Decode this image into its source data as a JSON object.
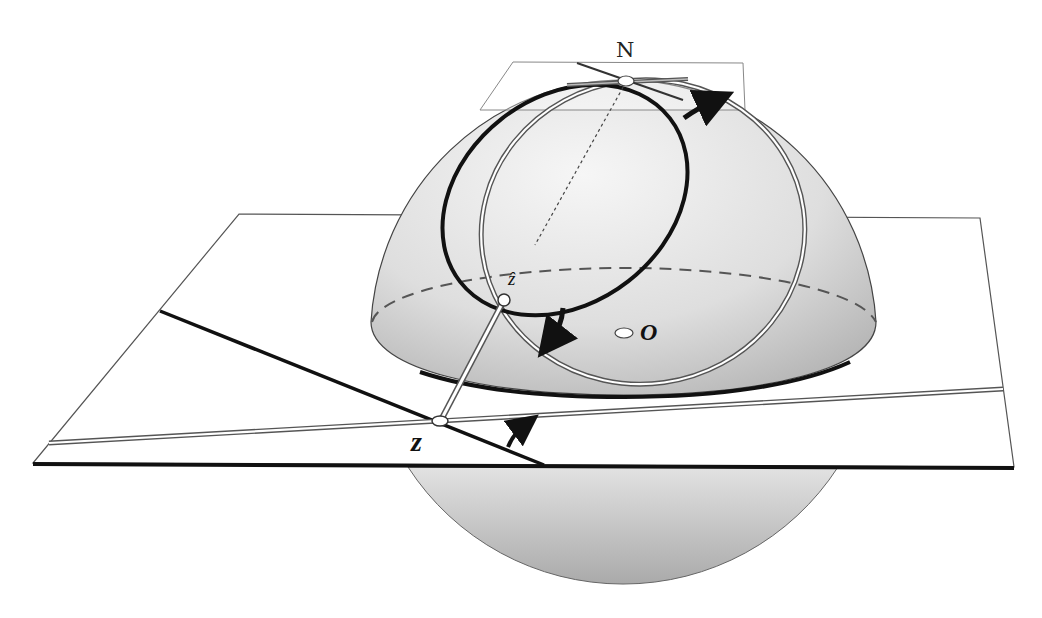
{
  "figure": {
    "labels": {
      "north_pole": "N",
      "sphere_point": "ẑ",
      "plane_point": "z",
      "center": "O"
    },
    "colors": {
      "sphere_fill_light": "#f2f2f2",
      "sphere_fill_dark": "#b8b8b8",
      "line_dark": "#111111",
      "line_gray": "#777777",
      "plane_fill": "#ffffff"
    }
  }
}
